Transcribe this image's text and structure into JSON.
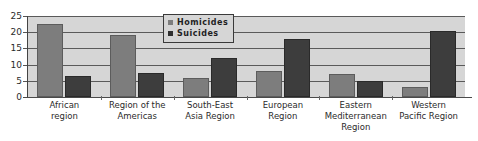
{
  "chart_data": {
    "type": "bar",
    "title": "",
    "xlabel": "",
    "ylabel": "",
    "ylim": [
      0,
      25
    ],
    "yticks": [
      0,
      5,
      10,
      15,
      20,
      25
    ],
    "grid": true,
    "legend_position": "top-center",
    "categories": [
      "African region",
      "Region of the Americas",
      "South-East Asia Region",
      "European Region",
      "Eastern Mediterranean Region",
      "Western Pacific Region"
    ],
    "category_lines": [
      [
        "African",
        "region"
      ],
      [
        "Region of the",
        "Americas"
      ],
      [
        "South-East",
        "Asia Region"
      ],
      [
        "European",
        "Region"
      ],
      [
        "Eastern",
        "Mediterranean",
        "Region"
      ],
      [
        "Western",
        "Pacific Region"
      ]
    ],
    "series": [
      {
        "name": "Homicides",
        "color": "#7d7d7d",
        "values": [
          22.5,
          19.0,
          6.0,
          8.0,
          7.0,
          3.0
        ]
      },
      {
        "name": "Suicides",
        "color": "#3d3d3d",
        "values": [
          6.5,
          7.5,
          12.0,
          18.0,
          5.0,
          20.5
        ]
      }
    ]
  },
  "legend": {
    "items": [
      {
        "label": "Homicides",
        "swatch": "homicides"
      },
      {
        "label": "Suicides",
        "swatch": "suicides"
      }
    ]
  },
  "axis": {
    "y_tick_labels": [
      "25",
      "20",
      "15",
      "10",
      "5",
      "0"
    ]
  }
}
